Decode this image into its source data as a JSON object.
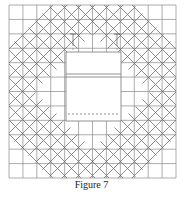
{
  "figure": {
    "caption": "Figure 7",
    "grid": {
      "x0": 9,
      "y0": 5,
      "x1": 176,
      "y1": 178,
      "cols": 12,
      "rows": 12,
      "color": "#8a8a8a"
    },
    "diagonals": {
      "center_x": 92.5,
      "center_y": 91.5,
      "spacing": 14,
      "inner_radius": 58,
      "outer_radius": 128,
      "color": "#6a6a6a"
    },
    "center_panel": {
      "x": 66,
      "y": 52,
      "width": 55,
      "height": 69,
      "double_line_y": [
        74,
        77
      ],
      "dashed_line_y": 114,
      "color": "#777777"
    },
    "markers": [
      {
        "x": 73,
        "y_top": 34,
        "y_bottom": 52
      },
      {
        "x": 117,
        "y_top": 34,
        "y_bottom": 52
      }
    ]
  }
}
